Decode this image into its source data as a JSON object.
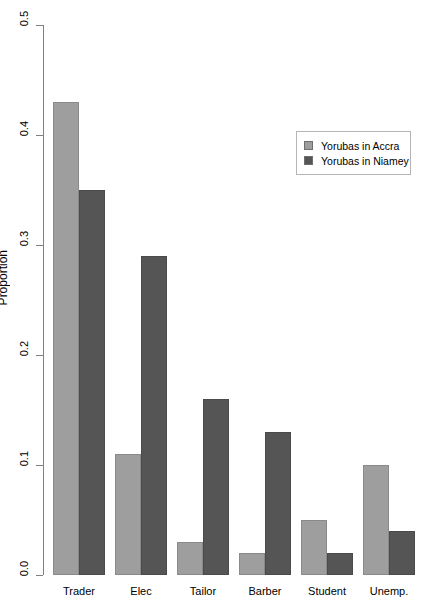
{
  "chart_data": {
    "type": "bar",
    "title": "",
    "xlabel": "",
    "ylabel": "Proportion",
    "categories": [
      "Trader",
      "Elec",
      "Tailor",
      "Barber",
      "Student",
      "Unemp."
    ],
    "series": [
      {
        "name": "Yorubas in Accra",
        "color": "#9e9e9e",
        "values": [
          0.43,
          0.11,
          0.03,
          0.02,
          0.05,
          0.1
        ]
      },
      {
        "name": "Yorubas in Niamey",
        "color": "#555555",
        "values": [
          0.35,
          0.29,
          0.16,
          0.13,
          0.02,
          0.04
        ]
      }
    ],
    "ylim": [
      0.0,
      0.5
    ],
    "yticks": [
      "0.0",
      "0.1",
      "0.2",
      "0.3",
      "0.4",
      "0.5"
    ],
    "ytick_values": [
      0.0,
      0.1,
      0.2,
      0.3,
      0.4,
      0.5
    ],
    "grid": false,
    "legend_position": "top-right",
    "grouping": "grouped"
  },
  "legend": {
    "entries": [
      {
        "label": "Yorubas in Accra"
      },
      {
        "label": "Yorubas in Niamey"
      }
    ]
  },
  "axes": {
    "y_title": "Proportion"
  }
}
